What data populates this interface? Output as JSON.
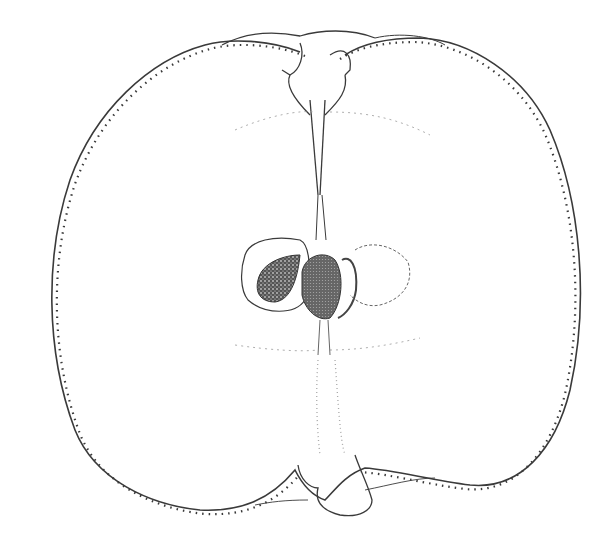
{
  "illustration": {
    "subject": "apple-cross-section",
    "background": "#ffffff",
    "stroke_color": "#3a3a3a",
    "seed_color": "#4a4a4a",
    "elements": [
      "outer-skin",
      "stem-cavity",
      "core-line",
      "seed-left",
      "seed-center",
      "carpel-right",
      "calyx-basin"
    ]
  }
}
